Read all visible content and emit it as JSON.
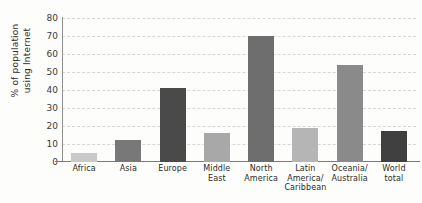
{
  "chart_data": {
    "type": "bar",
    "title": "",
    "xlabel": "",
    "ylabel": "% of population using Internet",
    "ylabel_lines": [
      "% of population",
      "using Internet"
    ],
    "ylim": [
      0,
      80
    ],
    "ytick_step": 10,
    "yticks": [
      80,
      70,
      60,
      50,
      40,
      30,
      20,
      10,
      0
    ],
    "grid": true,
    "grid_style": "dashed-horizontal",
    "legend": "none",
    "categories": [
      "Africa",
      "Asia",
      "Europe",
      "Middle East",
      "North America",
      "Latin America/Caribbean",
      "Oceania/Australia",
      "World total"
    ],
    "category_label_lines": [
      [
        "Africa"
      ],
      [
        "Asia"
      ],
      [
        "Europe"
      ],
      [
        "Middle",
        "East"
      ],
      [
        "North",
        "America"
      ],
      [
        "Latin",
        "America/",
        "Caribbean"
      ],
      [
        "Oceania/",
        "Australia"
      ],
      [
        "World",
        "total"
      ]
    ],
    "values": [
      5,
      12,
      41,
      16,
      70,
      19,
      54,
      17
    ],
    "bar_colors": [
      "#c9c9c9",
      "#787878",
      "#4a4a4a",
      "#a8a8a8",
      "#6e6e6e",
      "#b5b5b5",
      "#8a8a8a",
      "#404040"
    ]
  },
  "colors": {
    "background": "#fdfdfb",
    "axis": "#7a7a7a",
    "gridline": "#d9d6cf",
    "text": "#2b2b2b"
  }
}
